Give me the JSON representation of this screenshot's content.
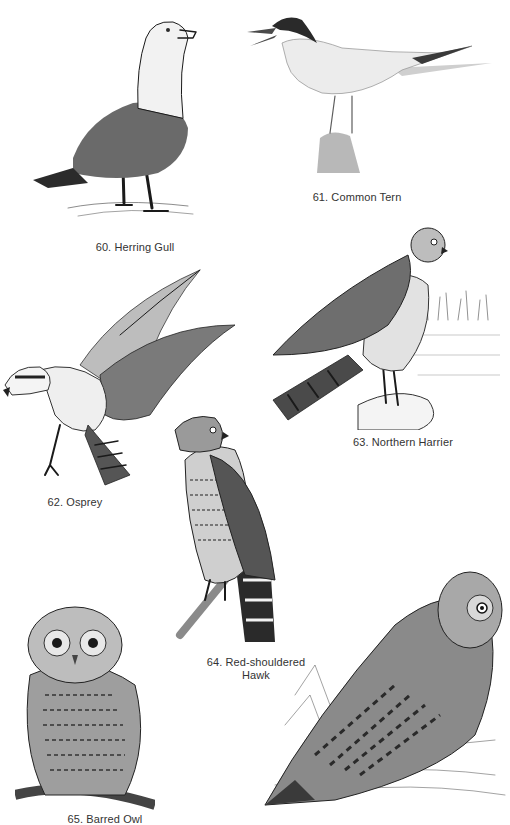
{
  "plates": [
    {
      "number": "60",
      "caption": "60. Herring Gull"
    },
    {
      "number": "61",
      "caption": "61. Common Tern"
    },
    {
      "number": "62",
      "caption": "62. Osprey"
    },
    {
      "number": "63",
      "caption": "63. Northern Harrier"
    },
    {
      "number": "64",
      "caption_line1": "64. Red-shouldered",
      "caption_line2": "Hawk"
    },
    {
      "number": "65",
      "caption": "65. Barred Owl"
    },
    {
      "number": "66",
      "caption": ""
    }
  ]
}
